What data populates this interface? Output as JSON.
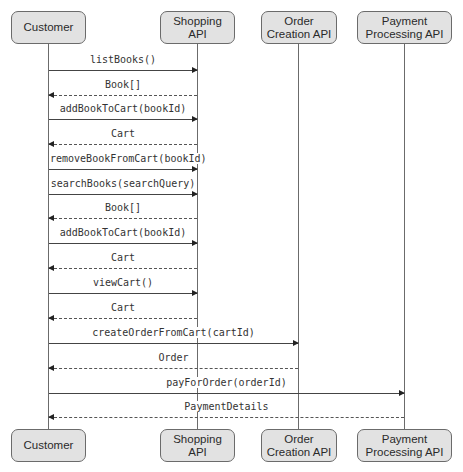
{
  "participants": [
    {
      "id": "customer",
      "label": "Customer",
      "x": 48,
      "left": 11,
      "width": 75
    },
    {
      "id": "shopping",
      "label": "Shopping API",
      "x": 197,
      "left": 160,
      "width": 75
    },
    {
      "id": "order",
      "label": "Order Creation API",
      "x": 298,
      "left": 261,
      "width": 76
    },
    {
      "id": "payment",
      "label": "Payment Processing API",
      "x": 404,
      "left": 357,
      "width": 95
    }
  ],
  "top_row_y": 11,
  "bottom_row_y": 429,
  "box_height": 33,
  "messages": [
    {
      "label": "listBooks()",
      "from": "customer",
      "to": "shopping",
      "type": "call",
      "y": 70
    },
    {
      "label": "Book[]",
      "from": "shopping",
      "to": "customer",
      "type": "return",
      "y": 95
    },
    {
      "label": "addBookToCart(bookId)",
      "from": "customer",
      "to": "shopping",
      "type": "call",
      "y": 119
    },
    {
      "label": "Cart",
      "from": "shopping",
      "to": "customer",
      "type": "return",
      "y": 144
    },
    {
      "label": "removeBookFromCart(bookId)",
      "from": "customer",
      "to": "shopping",
      "type": "call",
      "y": 169
    },
    {
      "label": "searchBooks(searchQuery)",
      "from": "customer",
      "to": "shopping",
      "type": "call",
      "y": 194
    },
    {
      "label": "Book[]",
      "from": "shopping",
      "to": "customer",
      "type": "return",
      "y": 218
    },
    {
      "label": "addBookToCart(bookId)",
      "from": "customer",
      "to": "shopping",
      "type": "call",
      "y": 243
    },
    {
      "label": "Cart",
      "from": "shopping",
      "to": "customer",
      "type": "return",
      "y": 268
    },
    {
      "label": "viewCart()",
      "from": "customer",
      "to": "shopping",
      "type": "call",
      "y": 293
    },
    {
      "label": "Cart",
      "from": "shopping",
      "to": "customer",
      "type": "return",
      "y": 318
    },
    {
      "label": "createOrderFromCart(cartId)",
      "from": "customer",
      "to": "order",
      "type": "call",
      "y": 343
    },
    {
      "label": "Order",
      "from": "order",
      "to": "customer",
      "type": "return",
      "y": 368
    },
    {
      "label": "payForOrder(orderId)",
      "from": "customer",
      "to": "payment",
      "type": "call",
      "y": 393
    },
    {
      "label": "PaymentDetails",
      "from": "payment",
      "to": "customer",
      "type": "return",
      "y": 417
    }
  ]
}
